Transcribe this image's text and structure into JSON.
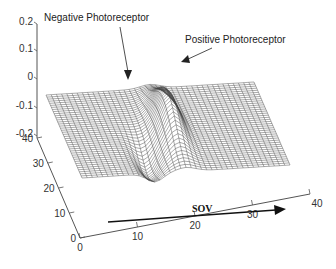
{
  "chart_data": {
    "type": "surface",
    "title": "",
    "xlabel": "",
    "ylabel": "",
    "zlabel": "",
    "xlim": [
      0,
      40
    ],
    "ylim": [
      0,
      40
    ],
    "zlim": [
      -0.2,
      0.2
    ],
    "x_ticks": [
      "0",
      "10",
      "20",
      "30",
      "40"
    ],
    "y_ticks": [
      "0",
      "10",
      "20",
      "30",
      "40"
    ],
    "z_ticks": [
      "0.2",
      "0.1",
      "0",
      "-0.1",
      "-0.2"
    ],
    "grid_size": 40,
    "baseline_z": -0.08,
    "features": [
      {
        "name": "positive_peak",
        "x": 20,
        "z": 0.16,
        "note": "ridge along y"
      },
      {
        "name": "negative_trough",
        "x": 14,
        "z": -0.2,
        "note": "trough along y"
      }
    ],
    "annotations": [
      {
        "text": "Negative Photoreceptor",
        "points_to": "negative_trough"
      },
      {
        "text": "Positive Photoreceptor",
        "points_to": "positive_peak"
      },
      {
        "text": "SOV",
        "type": "arrow",
        "direction": "increasing x"
      }
    ]
  }
}
